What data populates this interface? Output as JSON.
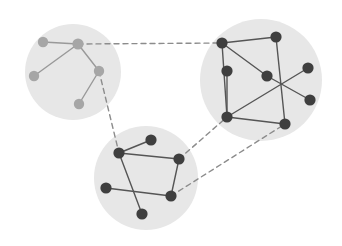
{
  "canvas": {
    "width": 342,
    "height": 246,
    "background": "#ffffff"
  },
  "style": {
    "blob_fill": "#e7e7e7",
    "node_dark": "#3f3f3f",
    "node_light": "#a6a6a6",
    "edge_dark": "#555555",
    "edge_light": "#999999",
    "dashed_edge": "#8c8c8c",
    "node_radius_dark": 5.6,
    "node_radius_light": 5.2,
    "edge_width": 1.4,
    "dash_pattern": "5,4"
  },
  "diagram": {
    "type": "clustered-graph",
    "cluster_count": 3,
    "node_count": 18,
    "intra_edge_count": 21,
    "inter_edge_count": 3
  },
  "clusters": [
    {
      "id": "cluster-left",
      "name": "left-cluster",
      "cx": 73,
      "cy": 72,
      "r": 48,
      "node_color": "#a6a6a6",
      "edge_color": "#999999",
      "node_count": 5
    },
    {
      "id": "cluster-right",
      "name": "right-cluster",
      "cx": 261,
      "cy": 80,
      "r": 61,
      "node_color": "#3f3f3f",
      "edge_color": "#555555",
      "node_count": 7
    },
    {
      "id": "cluster-bottom",
      "name": "bottom-cluster",
      "cx": 146,
      "cy": 178,
      "r": 52,
      "node_color": "#3f3f3f",
      "edge_color": "#555555",
      "node_count": 6
    }
  ],
  "nodes": [
    {
      "id": "L1",
      "cluster": "cluster-left",
      "x": 43,
      "y": 42,
      "r": 5.2,
      "color": "#a6a6a6"
    },
    {
      "id": "L2",
      "cluster": "cluster-left",
      "x": 78,
      "y": 44,
      "r": 5.6,
      "color": "#a6a6a6"
    },
    {
      "id": "L3",
      "cluster": "cluster-left",
      "x": 34,
      "y": 76,
      "r": 5.2,
      "color": "#a6a6a6"
    },
    {
      "id": "L4",
      "cluster": "cluster-left",
      "x": 99,
      "y": 71,
      "r": 5.2,
      "color": "#a6a6a6"
    },
    {
      "id": "L5",
      "cluster": "cluster-left",
      "x": 79,
      "y": 104,
      "r": 5.2,
      "color": "#a6a6a6"
    },
    {
      "id": "R1",
      "cluster": "cluster-right",
      "x": 222,
      "y": 43,
      "r": 5.6,
      "color": "#3f3f3f"
    },
    {
      "id": "R2",
      "cluster": "cluster-right",
      "x": 276,
      "y": 37,
      "r": 5.6,
      "color": "#3f3f3f"
    },
    {
      "id": "R3",
      "cluster": "cluster-right",
      "x": 227,
      "y": 71,
      "r": 5.6,
      "color": "#3f3f3f"
    },
    {
      "id": "R4",
      "cluster": "cluster-right",
      "x": 267,
      "y": 76,
      "r": 5.6,
      "color": "#3f3f3f"
    },
    {
      "id": "R5",
      "cluster": "cluster-right",
      "x": 308,
      "y": 68,
      "r": 5.6,
      "color": "#3f3f3f"
    },
    {
      "id": "R6",
      "cluster": "cluster-right",
      "x": 310,
      "y": 100,
      "r": 5.6,
      "color": "#3f3f3f"
    },
    {
      "id": "R7",
      "cluster": "cluster-right",
      "x": 227,
      "y": 117,
      "r": 5.6,
      "color": "#3f3f3f"
    },
    {
      "id": "R8",
      "cluster": "cluster-right",
      "x": 285,
      "y": 124,
      "r": 5.6,
      "color": "#3f3f3f"
    },
    {
      "id": "B1",
      "cluster": "cluster-bottom",
      "x": 151,
      "y": 140,
      "r": 5.6,
      "color": "#3f3f3f"
    },
    {
      "id": "B2",
      "cluster": "cluster-bottom",
      "x": 119,
      "y": 153,
      "r": 5.6,
      "color": "#3f3f3f"
    },
    {
      "id": "B3",
      "cluster": "cluster-bottom",
      "x": 179,
      "y": 159,
      "r": 5.6,
      "color": "#3f3f3f"
    },
    {
      "id": "B4",
      "cluster": "cluster-bottom",
      "x": 106,
      "y": 188,
      "r": 5.6,
      "color": "#3f3f3f"
    },
    {
      "id": "B5",
      "cluster": "cluster-bottom",
      "x": 171,
      "y": 196,
      "r": 5.6,
      "color": "#3f3f3f"
    },
    {
      "id": "B6",
      "cluster": "cluster-bottom",
      "x": 142,
      "y": 214,
      "r": 5.6,
      "color": "#3f3f3f"
    }
  ],
  "edges": [
    {
      "from": "L1",
      "to": "L2",
      "kind": "solid",
      "color": "#999999"
    },
    {
      "from": "L2",
      "to": "L3",
      "kind": "solid",
      "color": "#999999"
    },
    {
      "from": "L2",
      "to": "L4",
      "kind": "solid",
      "color": "#999999"
    },
    {
      "from": "L4",
      "to": "L5",
      "kind": "solid",
      "color": "#999999"
    },
    {
      "from": "R1",
      "to": "R2",
      "kind": "solid",
      "color": "#555555"
    },
    {
      "from": "R1",
      "to": "R4",
      "kind": "solid",
      "color": "#555555"
    },
    {
      "from": "R1",
      "to": "R7",
      "kind": "solid",
      "color": "#555555"
    },
    {
      "from": "R2",
      "to": "R8",
      "kind": "solid",
      "color": "#555555"
    },
    {
      "from": "R3",
      "to": "R7",
      "kind": "solid",
      "color": "#555555"
    },
    {
      "from": "R4",
      "to": "R6",
      "kind": "solid",
      "color": "#555555"
    },
    {
      "from": "R5",
      "to": "R7",
      "kind": "solid",
      "color": "#555555"
    },
    {
      "from": "R7",
      "to": "R8",
      "kind": "solid",
      "color": "#555555"
    },
    {
      "from": "B1",
      "to": "B2",
      "kind": "solid",
      "color": "#555555"
    },
    {
      "from": "B2",
      "to": "B3",
      "kind": "solid",
      "color": "#555555"
    },
    {
      "from": "B2",
      "to": "B6",
      "kind": "solid",
      "color": "#555555"
    },
    {
      "from": "B3",
      "to": "B5",
      "kind": "solid",
      "color": "#555555"
    },
    {
      "from": "B4",
      "to": "B5",
      "kind": "solid",
      "color": "#555555"
    },
    {
      "from": "L2",
      "to": "R1",
      "kind": "dashed",
      "color": "#8c8c8c"
    },
    {
      "from": "L4",
      "to": "B2",
      "kind": "dashed",
      "color": "#8c8c8c"
    },
    {
      "from": "B3",
      "to": "R7",
      "kind": "dashed",
      "color": "#8c8c8c"
    },
    {
      "from": "B5",
      "to": "R8",
      "kind": "dashed",
      "color": "#8c8c8c"
    }
  ]
}
